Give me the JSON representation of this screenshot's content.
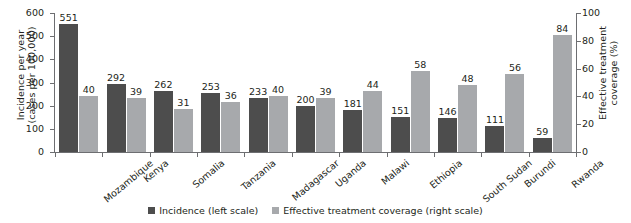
{
  "chart_data": {
    "type": "bar",
    "title": "",
    "subtitle": "",
    "xlabel": "",
    "ylabel": "Incidence per year\n(cases per 100,000)",
    "y2label": "Effective treatment\ncoverage (%)",
    "categories": [
      "Mozambique",
      "Kenya",
      "Somalia",
      "Tanzania",
      "Madagascar",
      "Uganda",
      "Malawi",
      "Ethiopia",
      "South Sudan",
      "Burundi",
      "Rwanda"
    ],
    "series": [
      {
        "name": "Incidence (left scale)",
        "axis": "left",
        "color": "#4d4d4d",
        "values": [
          551,
          292,
          262,
          253,
          233,
          200,
          181,
          151,
          146,
          111,
          59
        ]
      },
      {
        "name": "Effective treatment coverage (right scale)",
        "axis": "right",
        "color": "#a7a9ac",
        "values": [
          40,
          39,
          31,
          36,
          40,
          39,
          44,
          58,
          48,
          56,
          84
        ]
      }
    ],
    "ylim": [
      0,
      600
    ],
    "yticks": [
      0,
      100,
      200,
      300,
      400,
      500,
      600
    ],
    "y2lim": [
      0,
      100
    ],
    "y2ticks": [
      0,
      20,
      40,
      60,
      80,
      100
    ],
    "grid": false,
    "legend_position": "bottom"
  },
  "axes": {
    "left": {
      "title": "Incidence per year\n(cases per 100,000)",
      "ticks": [
        "600",
        "500",
        "400",
        "300",
        "200",
        "100",
        "0"
      ]
    },
    "right": {
      "title": "Effective treatment\ncoverage (%)",
      "ticks": [
        "100",
        "80",
        "60",
        "40",
        "20",
        "0"
      ]
    }
  },
  "legend": {
    "items": [
      {
        "label": "Incidence (left scale)",
        "color": "#4d4d4d"
      },
      {
        "label": "Effective treatment coverage (right scale)",
        "color": "#a7a9ac"
      }
    ]
  }
}
